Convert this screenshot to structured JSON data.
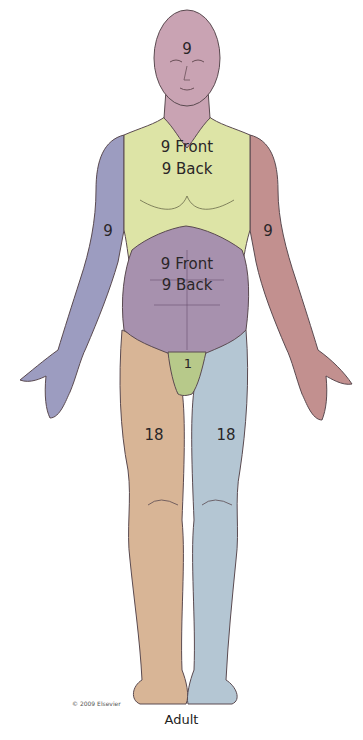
{
  "caption": "Adult",
  "copyright": "© 2009 Elsevier",
  "colors": {
    "head": "#c9a3b3",
    "chest": "#dde4a6",
    "abdomen": "#a791ae",
    "left_arm": "#9c9cc0",
    "right_arm": "#c2908f",
    "genitals": "#b7c98a",
    "left_leg": "#d8b596",
    "right_leg": "#b4c6d3",
    "outline": "#5a4a50"
  },
  "regions": {
    "head": {
      "label": "9",
      "percent": 9
    },
    "chest": {
      "line1": "9 Front",
      "line2": "9 Back",
      "front": 9,
      "back": 9
    },
    "abdomen": {
      "line1": "9 Front",
      "line2": "9 Back",
      "front": 9,
      "back": 9
    },
    "left_arm": {
      "label": "9",
      "percent": 9
    },
    "right_arm": {
      "label": "9",
      "percent": 9
    },
    "genitals": {
      "label": "1",
      "percent": 1
    },
    "left_leg": {
      "label": "18",
      "percent": 18
    },
    "right_leg": {
      "label": "18",
      "percent": 18
    }
  }
}
